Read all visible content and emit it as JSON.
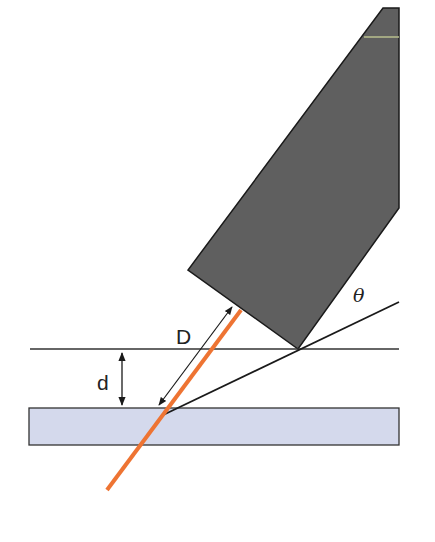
{
  "diagram": {
    "type": "geometry-schematic",
    "labels": {
      "distance_along_beam": "D",
      "vertical_gap": "d",
      "angle": "θ"
    },
    "elements": [
      {
        "name": "probe-body",
        "shape": "polygon",
        "color": "#5f5f5f"
      },
      {
        "name": "reference-plane",
        "shape": "line",
        "color": "#333333"
      },
      {
        "name": "sample-plate",
        "shape": "rect",
        "color": "#d4d9ec"
      },
      {
        "name": "beam",
        "shape": "line",
        "color": "#ee7433"
      },
      {
        "name": "angle-line",
        "shape": "line",
        "color": "#1a1a1a"
      },
      {
        "name": "D-arrow",
        "shape": "double-arrow",
        "color": "#1a1a1a"
      },
      {
        "name": "d-arrow",
        "shape": "double-arrow",
        "color": "#1a1a1a"
      }
    ],
    "colors": {
      "probe": "#5f5f5f",
      "plate": "#d4d9ec",
      "beam": "#ee7433",
      "line": "#1a1a1a",
      "accent_stripe": "#b9bf8e"
    }
  }
}
